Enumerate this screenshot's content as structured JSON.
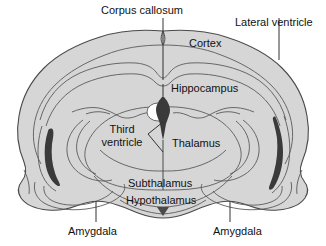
{
  "figure": {
    "background_color": "#ffffff",
    "brain_fill_color": "#d6d6d6",
    "outline_color": "#4a4a4a",
    "ventricle_color": "#3a3a3a",
    "label_color": "#111111",
    "leader_color": "#333333"
  },
  "labels": {
    "corpus_callosum": "Corpus callosum",
    "lateral_ventricle": "Lateral ventricle",
    "cortex": "Cortex",
    "hippocampus": "Hippocampus",
    "third_ventricle_line1": "Third",
    "third_ventricle_line2": "ventricle",
    "thalamus": "Thalamus",
    "subthalamus": "Subthalamus",
    "hypothalamus": "Hypothalamus",
    "amygdala_left": "Amygdala",
    "amygdala_right": "Amygdala"
  },
  "annotations": {
    "midline_arrow": "downward-triangle-marker"
  }
}
